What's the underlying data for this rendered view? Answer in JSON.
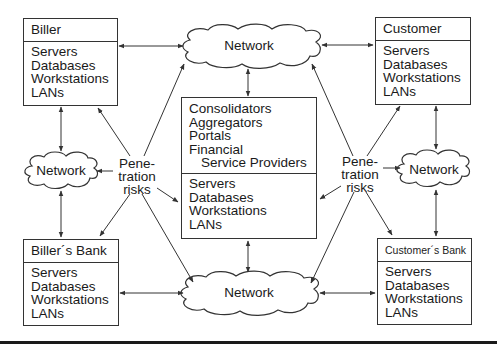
{
  "diagram": {
    "boxes": {
      "biller": {
        "title": "Biller",
        "items": [
          "Servers",
          "Databases",
          "Workstations",
          "LANs"
        ]
      },
      "customer": {
        "title": "Customer",
        "items": [
          "Servers",
          "Databases",
          "Workstations",
          "LANs"
        ]
      },
      "billers_bank": {
        "title": "Biller´s Bank",
        "items": [
          "Servers",
          "Databases",
          "Workstations",
          "LANs"
        ]
      },
      "customers_bank": {
        "title": "Customer´s Bank",
        "items": [
          "Servers",
          "Databases",
          "Workstations",
          "LANs"
        ]
      },
      "center": {
        "roles": [
          "Consolidators",
          "Aggregators",
          "Portals",
          "Financial",
          "Service Providers"
        ],
        "items": [
          "Servers",
          "Databases",
          "Workstations",
          "LANs"
        ]
      }
    },
    "networks": {
      "top": "Network",
      "left": "Network",
      "right": "Network",
      "bottom": "Network"
    },
    "risks": {
      "left": [
        "Pene-",
        "tration",
        "risks"
      ],
      "right": [
        "Pene-",
        "tration",
        "risks"
      ]
    },
    "colors": {
      "line": "#333333",
      "text": "#1a1a1a",
      "background": "#ffffff"
    }
  }
}
